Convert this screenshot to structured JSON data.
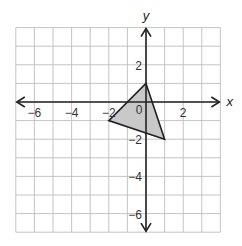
{
  "chart_data": {
    "type": "coordinate-plane",
    "title": "",
    "xlabel": "x",
    "ylabel": "y",
    "xlim": [
      -7,
      4
    ],
    "ylim": [
      -7,
      4
    ],
    "grid": true,
    "x_ticks": [
      {
        "value": -6,
        "label": "−6"
      },
      {
        "value": -4,
        "label": "−4"
      },
      {
        "value": -2,
        "label": "−2"
      },
      {
        "value": 2,
        "label": "2"
      }
    ],
    "y_ticks": [
      {
        "value": 2,
        "label": "2"
      },
      {
        "value": -2,
        "label": "−2"
      },
      {
        "value": -4,
        "label": "−4"
      },
      {
        "value": -6,
        "label": "−6"
      }
    ],
    "origin_label": "0",
    "shapes": [
      {
        "type": "triangle",
        "vertices": [
          [
            0,
            1
          ],
          [
            -2,
            -1
          ],
          [
            1,
            -2
          ]
        ],
        "fill": "#c9c9c9",
        "stroke": "#222222"
      }
    ]
  },
  "colors": {
    "grid": "#bdbdbd",
    "axis": "#222222",
    "background": "#ffffff"
  }
}
